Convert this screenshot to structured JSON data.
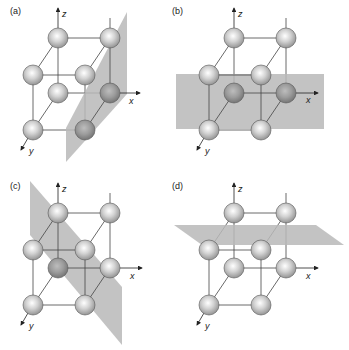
{
  "figure": {
    "panels": [
      {
        "label": "(a)",
        "plane": "vertical plane parallel to y-z through front-right edge",
        "highlighted_atoms": [
          "br-front",
          "br-back"
        ]
      },
      {
        "label": "(b)",
        "plane": "horizontal-looking vertical plane (x-z) through back atoms",
        "highlighted_atoms": [
          "bl-back",
          "br-back"
        ]
      },
      {
        "label": "(c)",
        "plane": "diagonal plane",
        "highlighted_atoms": [
          "bl-back"
        ]
      },
      {
        "label": "(d)",
        "plane": "horizontal x-y plane through back-bottom atoms",
        "highlighted_atoms": []
      }
    ],
    "axes": {
      "x": "x",
      "y": "y",
      "z": "z"
    },
    "colors": {
      "plane": "#b9b9b9",
      "atom": "#c4c4c4",
      "atom_highlight": "#9a9a9a",
      "edge": "#444444"
    }
  }
}
